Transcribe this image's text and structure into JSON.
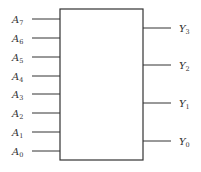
{
  "diagram": {
    "type": "encoder-block",
    "box": {
      "x": 60,
      "y": 9,
      "width": 83,
      "height": 151
    },
    "stroke_color": "#333333",
    "inputs": [
      {
        "base": "A",
        "sub": "7",
        "y": 19
      },
      {
        "base": "A",
        "sub": "6",
        "y": 38
      },
      {
        "base": "A",
        "sub": "5",
        "y": 57
      },
      {
        "base": "A",
        "sub": "4",
        "y": 76
      },
      {
        "base": "A",
        "sub": "3",
        "y": 94
      },
      {
        "base": "A",
        "sub": "2",
        "y": 113
      },
      {
        "base": "A",
        "sub": "1",
        "y": 132
      },
      {
        "base": "A",
        "sub": "0",
        "y": 151
      }
    ],
    "outputs": [
      {
        "base": "Y",
        "sub": "3",
        "y": 28
      },
      {
        "base": "Y",
        "sub": "2",
        "y": 65
      },
      {
        "base": "Y",
        "sub": "1",
        "y": 103
      },
      {
        "base": "Y",
        "sub": "0",
        "y": 141
      }
    ]
  }
}
